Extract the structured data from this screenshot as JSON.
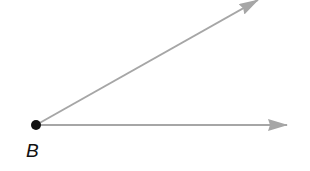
{
  "diagram": {
    "type": "angle",
    "vertex": {
      "label": "B",
      "x": 36,
      "y": 125
    },
    "rays": [
      {
        "name": "upper-ray",
        "x1": 36,
        "y1": 125,
        "x2": 258,
        "y2": 0
      },
      {
        "name": "horizontal-ray",
        "x1": 36,
        "y1": 125,
        "x2": 287,
        "y2": 125
      }
    ],
    "colors": {
      "ray": "#a6a6a6",
      "vertex": "#111111",
      "label": "#111111"
    }
  }
}
